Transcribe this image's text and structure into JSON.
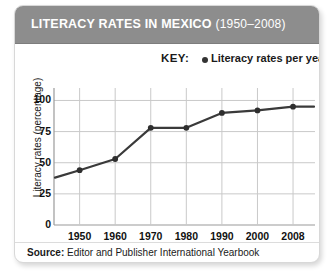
{
  "header": {
    "title_main": "LITERACY RATES IN MEXICO",
    "title_years": "(1950–2008)"
  },
  "legend": {
    "key_label": "KEY:",
    "marker_icon": "filled-circle-marker",
    "series_label": "Literacy rates per year",
    "marker_color": "#333333"
  },
  "source": {
    "label": "Source:",
    "text": "Editor and Publisher International Yearbook"
  },
  "chart_data": {
    "type": "line",
    "title": "LITERACY RATES IN MEXICO (1950–2008)",
    "xlabel": "",
    "ylabel": "Literacy rates (percentage)",
    "categories": [
      "1950",
      "1960",
      "1970",
      "1980",
      "1990",
      "2000",
      "2008"
    ],
    "x": [
      1950,
      1960,
      1970,
      1980,
      1990,
      2000,
      2008
    ],
    "values": [
      44,
      53,
      78,
      78,
      90,
      92,
      95
    ],
    "series": [
      {
        "name": "Literacy rates per year",
        "values": [
          44,
          53,
          78,
          78,
          90,
          92,
          95
        ],
        "color": "#3a3a3a"
      }
    ],
    "yticks": [
      0,
      25,
      50,
      75,
      100
    ],
    "ylim": [
      0,
      110
    ],
    "xtick_labels": [
      "1950",
      "1960",
      "1970",
      "1980",
      "1990",
      "2000",
      "2008"
    ],
    "grid": true,
    "legend_position": "top-right",
    "line_color": "#3a3a3a",
    "marker_color": "#2e2e2e",
    "gridline_color": "#c9c9c9"
  }
}
